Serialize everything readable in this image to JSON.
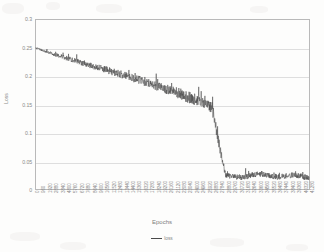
{
  "chart_data": {
    "type": "line",
    "title": "",
    "xlabel": "Epochs",
    "ylabel": "Loss",
    "ylim": [
      0,
      0.3
    ],
    "xlim": [
      0,
      41280
    ],
    "grid": true,
    "legend_position": "bottom",
    "y_ticks": [
      "0",
      "0.05",
      "0.1",
      "0.15",
      "0.2",
      "0.25",
      "0.3"
    ],
    "y_tick_values": [
      0,
      0.05,
      0.1,
      0.15,
      0.2,
      0.25,
      0.3
    ],
    "categories": [
      "0",
      "960",
      "1920",
      "2880",
      "3840",
      "4800",
      "5760",
      "6720",
      "7680",
      "8640",
      "9600",
      "10560",
      "11520",
      "12480",
      "13440",
      "14400",
      "15360",
      "16320",
      "17280",
      "18240",
      "19200",
      "20160",
      "21120",
      "22080",
      "23040",
      "24000",
      "24960",
      "25920",
      "26880",
      "27840",
      "28800",
      "29760",
      "30720",
      "31680",
      "32640",
      "33600",
      "34560",
      "35520",
      "36480",
      "37440",
      "38400",
      "39360",
      "40320",
      "41280"
    ],
    "series": [
      {
        "name": "loss",
        "color": "#4a4a4a",
        "values": [
          0.25,
          0.246,
          0.242,
          0.238,
          0.235,
          0.231,
          0.228,
          0.224,
          0.221,
          0.217,
          0.214,
          0.211,
          0.207,
          0.204,
          0.2,
          0.197,
          0.193,
          0.19,
          0.186,
          0.182,
          0.178,
          0.174,
          0.17,
          0.166,
          0.161,
          0.157,
          0.152,
          0.147,
          0.142,
          0.137,
          0.132,
          0.128,
          0.124,
          0.12,
          0.116,
          0.13,
          0.112,
          0.1,
          0.075,
          0.026,
          0.022,
          0.024,
          0.023,
          0.025
        ],
        "noise_profile": {
          "start_amplitude": 0.0015,
          "mid_amplitude": 0.011,
          "plateau_amplitude": 0.005
        },
        "plateau_level": 0.022,
        "spike": {
          "epoch": 23040,
          "value": 0.131
        },
        "drop_epoch": 25500
      }
    ]
  },
  "legend": {
    "entries": [
      {
        "label": "loss",
        "color": "#4a4a4a"
      }
    ]
  },
  "axes": {
    "x_title": "Epochs",
    "y_title": "Loss"
  }
}
